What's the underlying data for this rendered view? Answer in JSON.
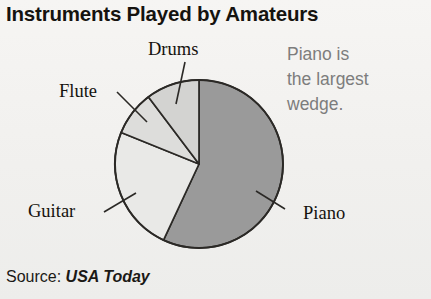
{
  "title": "Instruments Played by Amateurs",
  "callout": {
    "line1": "Piano is",
    "line2": "the largest",
    "line3": "wedge."
  },
  "source": {
    "prefix": "Source:",
    "attribution": "USA Today"
  },
  "colors": {
    "background": "#f2f1ef",
    "title_text": "#15130f",
    "label_text": "#14120e",
    "callout_text": "#7d7d7d",
    "outline": "#2b2926",
    "piano": "#9a9a9a",
    "guitar": "#e9e9e7",
    "flute": "#dddddb",
    "drums": "#d3d3d1"
  },
  "chart_data": {
    "type": "pie",
    "title": "Instruments Played by Amateurs",
    "xlabel": "",
    "ylabel": "",
    "legend_position": "none",
    "labels_on_wedges": true,
    "source": "USA Today",
    "annotation": "Piano is the largest wedge.",
    "categories": [
      "Piano",
      "Guitar",
      "Flute",
      "Drums"
    ],
    "values": [
      57,
      24,
      9,
      10
    ],
    "units": "percent",
    "slices": [
      {
        "label": "Piano",
        "value": 57,
        "color": "#9a9a9a",
        "start_angle_deg": 0,
        "end_angle_deg": 205,
        "label_x": 303,
        "label_y": 219,
        "leader_from_x": 285,
        "leader_from_y": 209,
        "leader_to_x": 256,
        "leader_to_y": 191
      },
      {
        "label": "Guitar",
        "value": 24,
        "color": "#e9e9e7",
        "start_angle_deg": 205,
        "end_angle_deg": 292,
        "label_x": 28,
        "label_y": 217,
        "leader_from_x": 104,
        "leader_from_y": 212,
        "leader_to_x": 136,
        "leader_to_y": 193
      },
      {
        "label": "Flute",
        "value": 9,
        "color": "#dddddb",
        "start_angle_deg": 292,
        "end_angle_deg": 323,
        "label_x": 59,
        "label_y": 97,
        "leader_from_x": 117,
        "leader_from_y": 92,
        "leader_to_x": 147,
        "leader_to_y": 122
      },
      {
        "label": "Drums",
        "value": 10,
        "color": "#d3d3d1",
        "start_angle_deg": 323,
        "end_angle_deg": 360,
        "label_x": 148,
        "label_y": 55,
        "leader_from_x": 185,
        "leader_from_y": 62,
        "leader_to_x": 176,
        "leader_to_y": 104
      }
    ],
    "geometry": {
      "center_x": 199,
      "center_y": 164,
      "radius": 84
    }
  }
}
